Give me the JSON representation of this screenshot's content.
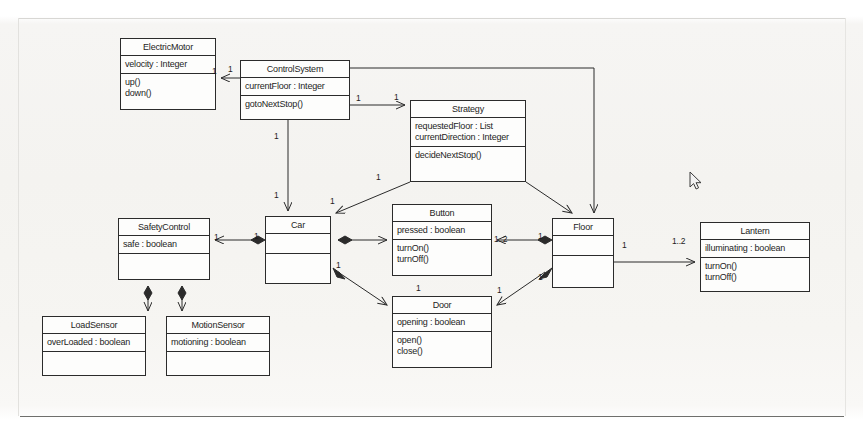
{
  "diagram": {
    "kind": "uml-class-diagram",
    "stroke_color": "#2b2b2b",
    "background_color": "#fbfbfa",
    "classes": [
      {
        "id": "electric-motor",
        "name": "ElectricMotor",
        "attributes": [
          "velocity : Integer"
        ],
        "operations": [
          "up()",
          "down()"
        ],
        "x": 120,
        "y": 38,
        "w": 96,
        "h": 72
      },
      {
        "id": "control-system",
        "name": "ControlSystem",
        "attributes": [
          "currentFloor : Integer"
        ],
        "operations": [
          "gotoNextStop()"
        ],
        "x": 240,
        "y": 60,
        "w": 110,
        "h": 60
      },
      {
        "id": "strategy",
        "name": "Strategy",
        "attributes": [
          "requestedFloor : List",
          "currentDirection : Integer"
        ],
        "operations": [
          "decideNextStop()"
        ],
        "x": 410,
        "y": 100,
        "w": 116,
        "h": 82
      },
      {
        "id": "safety-control",
        "name": "SafetyControl",
        "attributes": [
          "safe : boolean"
        ],
        "operations": [
          ""
        ],
        "x": 118,
        "y": 218,
        "w": 92,
        "h": 62
      },
      {
        "id": "car",
        "name": "Car",
        "attributes": [
          ""
        ],
        "operations": [
          ""
        ],
        "x": 265,
        "y": 216,
        "w": 66,
        "h": 68
      },
      {
        "id": "button",
        "name": "Button",
        "attributes": [
          "pressed : boolean"
        ],
        "operations": [
          "turnOn()",
          "turnOff()"
        ],
        "x": 392,
        "y": 204,
        "w": 100,
        "h": 72
      },
      {
        "id": "floor",
        "name": "Floor",
        "attributes": [
          ""
        ],
        "operations": [
          ""
        ],
        "x": 552,
        "y": 218,
        "w": 62,
        "h": 70
      },
      {
        "id": "lantern",
        "name": "Lantern",
        "attributes": [
          "illuminating : boolean"
        ],
        "operations": [
          "turnOn()",
          "turnOff()"
        ],
        "x": 700,
        "y": 222,
        "w": 110,
        "h": 70
      },
      {
        "id": "load-sensor",
        "name": "LoadSensor",
        "attributes": [
          "overLoaded : boolean"
        ],
        "operations": [
          ""
        ],
        "x": 42,
        "y": 316,
        "w": 104,
        "h": 60
      },
      {
        "id": "motion-sensor",
        "name": "MotionSensor",
        "attributes": [
          "motioning : boolean"
        ],
        "operations": [
          ""
        ],
        "x": 166,
        "y": 316,
        "w": 104,
        "h": 60
      },
      {
        "id": "door",
        "name": "Door",
        "attributes": [
          "opening : boolean"
        ],
        "operations": [
          "open()",
          "close()"
        ],
        "x": 392,
        "y": 296,
        "w": 100,
        "h": 72
      }
    ],
    "multiplicities": [
      {
        "id": "m-motor-end",
        "label": "1",
        "x": 212,
        "y": 66
      },
      {
        "id": "m-cs-to-motor",
        "label": "1",
        "x": 228,
        "y": 64
      },
      {
        "id": "m-cs-to-strategy",
        "label": "1",
        "x": 356,
        "y": 93
      },
      {
        "id": "m-strategy-end",
        "label": "1",
        "x": 394,
        "y": 92
      },
      {
        "id": "m-cs-to-car-top",
        "label": "1",
        "x": 274,
        "y": 131
      },
      {
        "id": "m-cs-to-car-bot",
        "label": "1",
        "x": 274,
        "y": 190
      },
      {
        "id": "m-strategy-to-car",
        "label": "1",
        "x": 376,
        "y": 172
      },
      {
        "id": "m-car-from-strat",
        "label": "1",
        "x": 330,
        "y": 196
      },
      {
        "id": "m-safety-end",
        "label": "1",
        "x": 214,
        "y": 232
      },
      {
        "id": "m-car-to-safety",
        "label": "1",
        "x": 254,
        "y": 231
      },
      {
        "id": "m-button-floor",
        "label": "1..2",
        "x": 494,
        "y": 234
      },
      {
        "id": "m-floor-button",
        "label": "1",
        "x": 538,
        "y": 231
      },
      {
        "id": "m-car-door",
        "label": "1",
        "x": 336,
        "y": 260
      },
      {
        "id": "m-door-end",
        "label": "1",
        "x": 416,
        "y": 283
      },
      {
        "id": "m-floor-door",
        "label": "1",
        "x": 538,
        "y": 272
      },
      {
        "id": "m-door-floor",
        "label": "1",
        "x": 497,
        "y": 285
      },
      {
        "id": "m-floor-lantern",
        "label": "1",
        "x": 622,
        "y": 240
      },
      {
        "id": "m-lantern-end",
        "label": "1..2",
        "x": 672,
        "y": 236
      }
    ],
    "cursor": {
      "id": "mouse-pointer",
      "x": 690,
      "y": 172
    }
  }
}
